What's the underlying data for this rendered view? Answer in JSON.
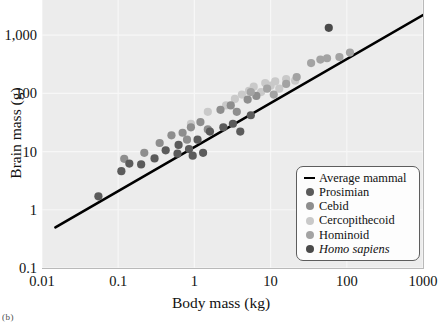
{
  "figure": {
    "caption_fragment": "(b)"
  },
  "axes": {
    "x": {
      "title": "Body mass (kg)",
      "scale": "log",
      "ticks": [
        "0.01",
        "0.1",
        "1",
        "10",
        "100",
        "1000"
      ],
      "tick_values": [
        0.01,
        0.1,
        1,
        10,
        100,
        1000
      ],
      "min": 0.01,
      "max": 1000
    },
    "y": {
      "title": "Brain mass (g)",
      "scale": "log",
      "ticks": [
        "0.1",
        "1",
        "10",
        "100",
        "1,000"
      ],
      "tick_values": [
        0.1,
        1,
        10,
        100,
        1000
      ],
      "min": 0.1,
      "max": 4000
    }
  },
  "legend": {
    "position": "bottom-right",
    "items": [
      {
        "label": "Average mammal",
        "marker": "line",
        "color": "#000000",
        "italic": false
      },
      {
        "label": "Prosimian",
        "marker": "dot",
        "color": "#5b5b5b",
        "italic": false
      },
      {
        "label": "Cebid",
        "marker": "dot",
        "color": "#8e8e8e",
        "italic": false
      },
      {
        "label": "Cercopithecoid",
        "marker": "dot",
        "color": "#c9c9c9",
        "italic": false
      },
      {
        "label": "Hominoid",
        "marker": "dot",
        "color": "#a3a3a3",
        "italic": false
      },
      {
        "label": "Homo sapiens",
        "marker": "dot",
        "color": "#4a4a4a",
        "italic": true
      }
    ]
  },
  "style": {
    "panel_background": "#ececec",
    "gridline_color": "#f7f7f7",
    "trendline_color": "#000000",
    "axis_text_color": "#111111"
  },
  "chart_data": {
    "type": "scatter",
    "title": "",
    "xlabel": "Body mass (kg)",
    "ylabel": "Brain mass (g)",
    "xscale": "log",
    "yscale": "log",
    "xlim": [
      0.01,
      1000
    ],
    "ylim": [
      0.1,
      4000
    ],
    "grid": true,
    "legend_position": "bottom-right",
    "trendline": {
      "name": "Average mammal",
      "color": "#000000",
      "x": [
        0.015,
        1000
      ],
      "y": [
        0.5,
        2200
      ]
    },
    "series": [
      {
        "name": "Prosimian",
        "color": "#5b5b5b",
        "points": [
          [
            0.055,
            1.7
          ],
          [
            0.11,
            4.6
          ],
          [
            0.14,
            6.2
          ],
          [
            0.2,
            6.0
          ],
          [
            0.3,
            7.6
          ],
          [
            0.42,
            10.5
          ],
          [
            0.6,
            9.2
          ],
          [
            0.62,
            13.0
          ],
          [
            0.85,
            11.0
          ],
          [
            0.95,
            8.5
          ],
          [
            1.1,
            16.0
          ],
          [
            1.3,
            9.5
          ],
          [
            1.6,
            22.0
          ],
          [
            2.4,
            26.0
          ],
          [
            3.2,
            30.0
          ],
          [
            4.0,
            22.0
          ],
          [
            5.5,
            42.0
          ]
        ]
      },
      {
        "name": "Cebid",
        "color": "#8e8e8e",
        "points": [
          [
            0.12,
            7.5
          ],
          [
            0.22,
            9.5
          ],
          [
            0.35,
            14.0
          ],
          [
            0.5,
            19.0
          ],
          [
            0.7,
            21.0
          ],
          [
            0.8,
            16.0
          ],
          [
            0.9,
            26.0
          ],
          [
            1.2,
            32.0
          ],
          [
            1.5,
            24.0
          ],
          [
            2.2,
            52.0
          ],
          [
            3.0,
            62.0
          ],
          [
            3.6,
            48.0
          ],
          [
            5.0,
            78.0
          ],
          [
            6.5,
            90.0
          ]
        ]
      },
      {
        "name": "Cercopithecoid",
        "color": "#c9c9c9",
        "points": [
          [
            0.9,
            30.0
          ],
          [
            1.5,
            48.0
          ],
          [
            2.6,
            62.0
          ],
          [
            3.4,
            80.0
          ],
          [
            4.2,
            95.0
          ],
          [
            5.2,
            110.0
          ],
          [
            6.0,
            130.0
          ],
          [
            7.5,
            105.0
          ],
          [
            8.5,
            150.0
          ],
          [
            10.0,
            135.0
          ],
          [
            11.5,
            160.0
          ],
          [
            13.0,
            120.0
          ],
          [
            16.0,
            175.0
          ],
          [
            21.0,
            165.0
          ]
        ]
      },
      {
        "name": "Hominoid",
        "color": "#a3a3a3",
        "points": [
          [
            5.5,
            105.0
          ],
          [
            9.0,
            120.0
          ],
          [
            11.0,
            95.0
          ],
          [
            16.0,
            145.0
          ],
          [
            22.0,
            190.0
          ],
          [
            34.0,
            330.0
          ],
          [
            45.0,
            380.0
          ],
          [
            55.0,
            400.0
          ],
          [
            80.0,
            420.0
          ],
          [
            110.0,
            500.0
          ]
        ]
      },
      {
        "name": "Homo sapiens",
        "color": "#4a4a4a",
        "points": [
          [
            58.0,
            1330.0
          ]
        ]
      }
    ]
  }
}
